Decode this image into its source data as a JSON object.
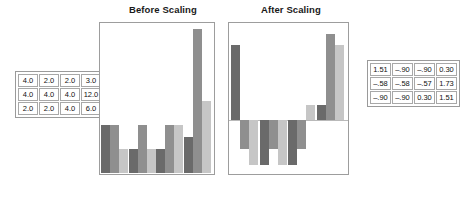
{
  "figure": {
    "panels": [
      {
        "id": "before",
        "title": "Before Scaling"
      },
      {
        "id": "after",
        "title": "After Scaling"
      }
    ]
  },
  "tables": {
    "before": {
      "name": "raw-data-table",
      "rows": [
        [
          "4.0",
          "2.0",
          "2.0",
          "3.0"
        ],
        [
          "4.0",
          "4.0",
          "4.0",
          "12.0"
        ],
        [
          "2.0",
          "2.0",
          "4.0",
          "6.0"
        ]
      ]
    },
    "after": {
      "name": "scaled-data-table",
      "rows": [
        [
          "1.51",
          "–.90",
          "–.90",
          "0.30"
        ],
        [
          "–.58",
          "–.58",
          "–.57",
          "1.73"
        ],
        [
          "–.90",
          "–.90",
          "0.30",
          "1.51"
        ]
      ]
    }
  },
  "colors": {
    "series_1": "#6a6a6a",
    "series_2": "#8f8f8f",
    "series_3": "#c6c6c6",
    "frame": "#9d9d9d",
    "zero_line": "#b9b9b9",
    "text": "#1a1a1a"
  },
  "chart_data": [
    {
      "type": "bar",
      "title": "Before Scaling",
      "xlabel": "",
      "ylabel": "",
      "categories": [
        "1",
        "2",
        "3",
        "4"
      ],
      "ylim": [
        0,
        12
      ],
      "grid": false,
      "legend": "none",
      "series": [
        {
          "name": "Row 1",
          "color": "#6a6a6a",
          "values": [
            4.0,
            2.0,
            2.0,
            3.0
          ]
        },
        {
          "name": "Row 2",
          "color": "#8f8f8f",
          "values": [
            4.0,
            4.0,
            4.0,
            12.0
          ]
        },
        {
          "name": "Row 3",
          "color": "#c6c6c6",
          "values": [
            2.0,
            2.0,
            4.0,
            6.0
          ]
        }
      ]
    },
    {
      "type": "bar",
      "title": "After Scaling",
      "xlabel": "",
      "ylabel": "",
      "categories": [
        "1",
        "2",
        "3",
        "4"
      ],
      "ylim": [
        -1.0,
        1.8
      ],
      "grid": false,
      "legend": "none",
      "series": [
        {
          "name": "Row 1",
          "color": "#6a6a6a",
          "values": [
            1.51,
            -0.9,
            -0.9,
            0.3
          ]
        },
        {
          "name": "Row 2",
          "color": "#8f8f8f",
          "values": [
            -0.58,
            -0.58,
            -0.57,
            1.73
          ]
        },
        {
          "name": "Row 3",
          "color": "#c6c6c6",
          "values": [
            -0.9,
            -0.9,
            0.3,
            1.51
          ]
        }
      ]
    }
  ]
}
